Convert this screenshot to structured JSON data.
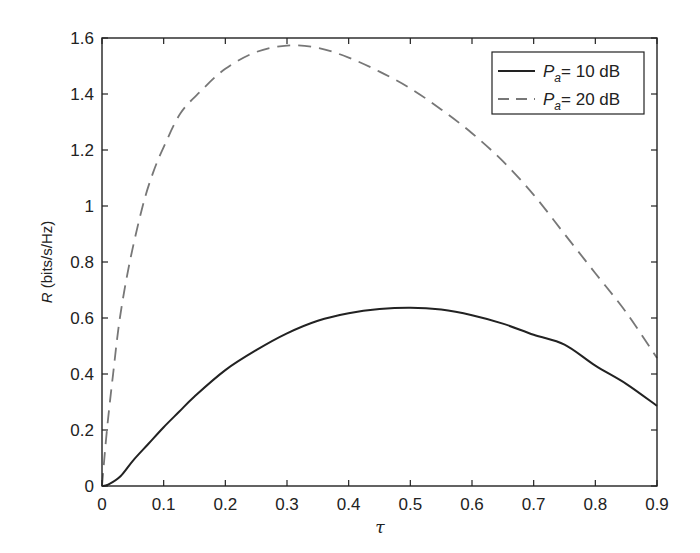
{
  "chart_data": {
    "type": "line",
    "title": "",
    "xlabel": "τ",
    "ylabel_var": "R",
    "ylabel_unit": " (bits/s/Hz)",
    "xlim": [
      0,
      0.9
    ],
    "ylim": [
      0,
      1.6
    ],
    "grid": false,
    "legend_position": "upper right",
    "x_ticks": [
      "0",
      "0.1",
      "0.2",
      "0.3",
      "0.4",
      "0.5",
      "0.6",
      "0.7",
      "0.8",
      "0.9"
    ],
    "y_ticks": [
      "0",
      "0.2",
      "0.4",
      "0.6",
      "0.8",
      "1",
      "1.2",
      "1.4",
      "1.6"
    ],
    "series": [
      {
        "name": "P_a = 10 dB",
        "legend_var": "P",
        "legend_sub": "a",
        "legend_rest": "= 10 dB",
        "style": "solid",
        "color": "#222222",
        "x": [
          0,
          0.01,
          0.03,
          0.05,
          0.075,
          0.1,
          0.125,
          0.15,
          0.2,
          0.25,
          0.3,
          0.35,
          0.4,
          0.45,
          0.5,
          0.55,
          0.6,
          0.65,
          0.7,
          0.75,
          0.8,
          0.85,
          0.9
        ],
        "y": [
          0,
          0.005,
          0.035,
          0.09,
          0.15,
          0.21,
          0.265,
          0.32,
          0.414,
          0.485,
          0.545,
          0.59,
          0.617,
          0.632,
          0.637,
          0.63,
          0.61,
          0.58,
          0.54,
          0.505,
          0.43,
          0.365,
          0.286
        ]
      },
      {
        "name": "P_a = 20 dB",
        "legend_var": "P",
        "legend_sub": "a",
        "legend_rest": "= 20 dB",
        "style": "dashed",
        "color": "#777777",
        "x": [
          0,
          0.008,
          0.018,
          0.029,
          0.045,
          0.066,
          0.083,
          0.1,
          0.127,
          0.16,
          0.2,
          0.25,
          0.3,
          0.35,
          0.4,
          0.45,
          0.5,
          0.55,
          0.6,
          0.65,
          0.7,
          0.75,
          0.8,
          0.85,
          0.9
        ],
        "y": [
          0,
          0.2,
          0.4,
          0.6,
          0.8,
          1.0,
          1.12,
          1.21,
          1.33,
          1.41,
          1.49,
          1.55,
          1.573,
          1.565,
          1.53,
          1.48,
          1.42,
          1.345,
          1.26,
          1.16,
          1.04,
          0.9,
          0.76,
          0.62,
          0.457
        ]
      }
    ]
  }
}
